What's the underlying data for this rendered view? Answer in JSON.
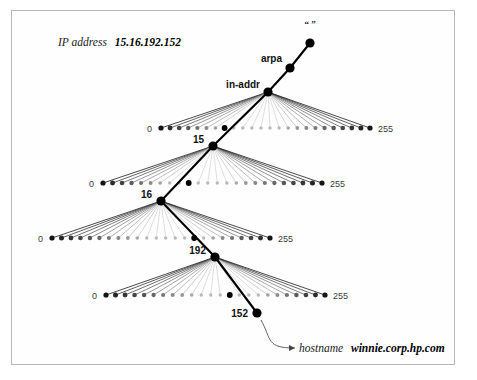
{
  "figure": {
    "background_color": "#ffffff",
    "frame_color": "#b8b8b8",
    "node_color": "#000000",
    "path_color": "#000000",
    "fan_color": "#555555",
    "dim_color": "#c9c9c9"
  },
  "caption_top": {
    "prefix": "IP address",
    "value": "15.16.192.152",
    "x": 58,
    "y": 46
  },
  "caption_bottom": {
    "prefix": "hostname",
    "value": "winnie.corp.hp.com",
    "x": 299,
    "y": 352
  },
  "root": {
    "label": "“ ”",
    "x": 310,
    "y": 43,
    "label_x": 310,
    "label_y": 27
  },
  "path_nodes": [
    {
      "name": "arpa-node",
      "label": "arpa",
      "x": 290,
      "y": 68,
      "label_x": 282,
      "label_y": 62,
      "label_anchor": "end"
    },
    {
      "name": "in-addr-node",
      "label": "in-addr",
      "x": 268,
      "y": 92,
      "label_x": 260,
      "label_y": 88,
      "label_anchor": "end"
    },
    {
      "name": "octet1-node",
      "label": "15",
      "x": 213,
      "y": 146,
      "label_x": 204,
      "label_y": 143,
      "label_anchor": "end"
    },
    {
      "name": "octet2-node",
      "label": "16",
      "x": 161,
      "y": 201,
      "label_x": 152,
      "label_y": 198,
      "label_anchor": "end"
    },
    {
      "name": "octet3-node",
      "label": "192",
      "x": 215,
      "y": 257,
      "label_x": 206,
      "label_y": 254,
      "label_anchor": "end"
    },
    {
      "name": "octet4-node",
      "label": "152",
      "x": 257,
      "y": 313,
      "label_x": 248,
      "label_y": 317,
      "label_anchor": "end"
    }
  ],
  "fans": [
    {
      "name": "fan-in-addr",
      "parent": "in-addr",
      "parent_x": 268,
      "parent_y": 92,
      "row_y": 128,
      "left_x": 161,
      "right_x": 370,
      "left_label": "0",
      "right_label": "255",
      "left_label_x": 152,
      "right_label_x": 378,
      "selected_index": 7,
      "selected_label": "15",
      "count": 24,
      "bright_left": 7,
      "bright_right": 10
    },
    {
      "name": "fan-15",
      "parent": "15",
      "parent_x": 213,
      "parent_y": 146,
      "row_y": 183,
      "left_x": 103,
      "right_x": 322,
      "left_label": "0",
      "right_label": "255",
      "left_label_x": 94,
      "right_label_x": 330,
      "selected_index": 9,
      "selected_label": "16",
      "count": 24,
      "bright_left": 7,
      "bright_right": 10
    },
    {
      "name": "fan-16",
      "parent": "16",
      "parent_x": 161,
      "parent_y": 201,
      "row_y": 238,
      "left_x": 52,
      "right_x": 270,
      "left_label": "0",
      "right_label": "255",
      "left_label_x": 43,
      "right_label_x": 278,
      "selected_index": 15,
      "selected_label": "192",
      "count": 24,
      "bright_left": 10,
      "bright_right": 7
    },
    {
      "name": "fan-192",
      "parent": "192",
      "parent_x": 215,
      "parent_y": 257,
      "row_y": 295,
      "left_x": 106,
      "right_x": 325,
      "left_label": "0",
      "right_label": "255",
      "left_label_x": 97,
      "right_label_x": 333,
      "selected_index": 13,
      "selected_label": "152",
      "count": 24,
      "bright_left": 10,
      "bright_right": 7
    }
  ],
  "leader_line": {
    "name": "hostname-leader",
    "from_x": 261,
    "from_y": 320,
    "to_x": 295,
    "to_y": 348
  }
}
